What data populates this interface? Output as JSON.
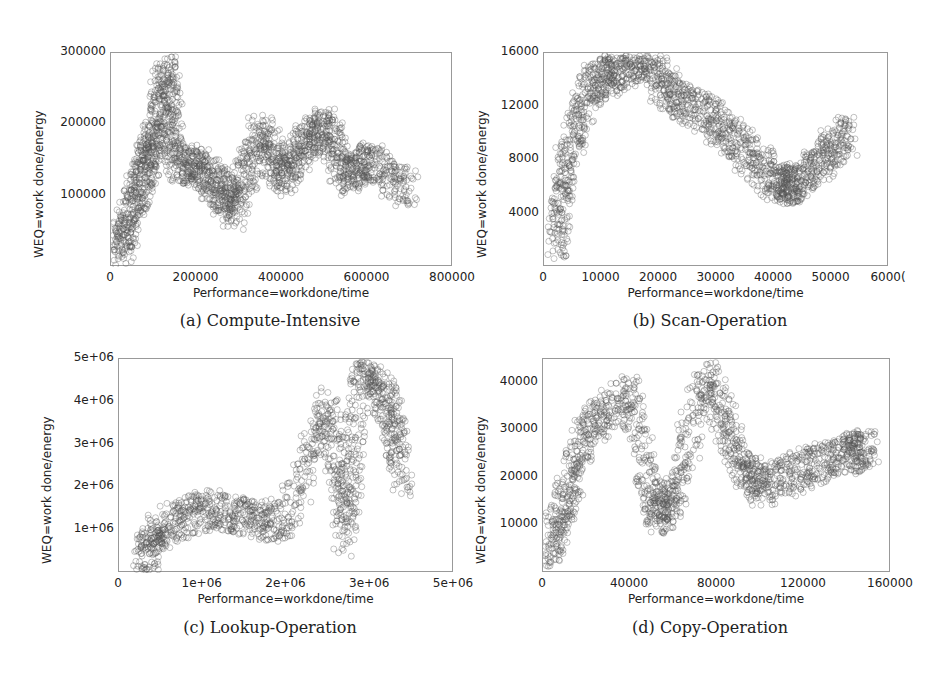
{
  "chart_data": [
    {
      "type": "scatter",
      "caption": "(a) Compute-Intensive",
      "xlabel": "Performance=workdone/time",
      "ylabel": "WEQ=work done/energy",
      "xlim": [
        0,
        800000
      ],
      "ylim": [
        0,
        300000
      ],
      "xticks": [
        "0",
        "200000",
        "400000",
        "600000",
        "800000"
      ],
      "yticks": [
        "100000",
        "200000",
        "300000"
      ],
      "marker": "open-circle",
      "points_description": "Dense cluster rising from origin to ~150000 perf; arcs peaking ~280000 WEQ near 130000 perf; diagonal streaks extending to ~700000 perf at 100000-220000 WEQ",
      "x": [
        20000,
        50000,
        80000,
        100000,
        130000,
        150000,
        200000,
        250000,
        290000,
        350000,
        400000,
        450000,
        500000,
        550000,
        600000,
        700000
      ],
      "y": [
        20000,
        80000,
        140000,
        180000,
        280000,
        150000,
        140000,
        110000,
        80000,
        190000,
        125000,
        170000,
        200000,
        125000,
        150000,
        105000
      ]
    },
    {
      "type": "scatter",
      "caption": "(b) Scan-Operation",
      "xlabel": "Performance=workdone/time",
      "ylabel": "WEQ=work done/energy",
      "xlim": [
        0,
        60000
      ],
      "ylim": [
        0,
        16000
      ],
      "xticks": [
        "0",
        "10000",
        "20000",
        "30000",
        "40000",
        "50000",
        "6000("
      ],
      "yticks": [
        "4000",
        "8000",
        "12000",
        "16000"
      ],
      "marker": "open-circle",
      "points_description": "Steep rise from ~1000 at 2000 perf to peak ~15500 near 17000 perf; broad arc decaying to ~6000 at 43000 perf; sparse outliers to 53000",
      "x": [
        2000,
        4000,
        8000,
        12000,
        17000,
        22000,
        28000,
        34000,
        40000,
        43000,
        48000,
        53000
      ],
      "y": [
        1000,
        8000,
        13500,
        14500,
        15500,
        13000,
        11500,
        9000,
        6500,
        6000,
        8000,
        10000
      ]
    },
    {
      "type": "scatter",
      "caption": "(c) Lookup-Operation",
      "xlabel": "Performance=workdone/time",
      "ylabel": "WEQ=work done/energy",
      "xlim": [
        0,
        4000000
      ],
      "ylim": [
        0,
        5000000
      ],
      "xticks": [
        "0",
        "1e+06",
        "2e+06",
        "3e+06",
        "5e+06"
      ],
      "yticks": [
        "1e+06",
        "2e+06",
        "3e+06",
        "4e+06",
        "5e+06"
      ],
      "marker": "open-circle",
      "points_description": "Dense blob 0.5e6-2.7e6 perf, 0.3e6-2e6 WEQ; sparse upper cloud rising to ~4.8e6 WEQ near 2.9e6 perf",
      "x": [
        250000,
        500000,
        1000000,
        1500000,
        2000000,
        2500000,
        2700000,
        2900000,
        3200000,
        3400000
      ],
      "y": [
        250000,
        1000000,
        1500000,
        1300000,
        1200000,
        4000000,
        800000,
        4800000,
        4000000,
        2200000
      ]
    },
    {
      "type": "scatter",
      "caption": "(d) Copy-Operation",
      "xlabel": "Performance=workdone/time",
      "ylabel": "WEQ=work done/energy",
      "xlim": [
        0,
        160000
      ],
      "ylim": [
        0,
        45000
      ],
      "xticks": [
        "0",
        "40000",
        "80000",
        "120000",
        "160000"
      ],
      "yticks": [
        "10000",
        "20000",
        "30000",
        "40000"
      ],
      "marker": "open-circle",
      "points_description": "Steep rise from ~2000 at 2000 perf to ~30000 at 20000; broad arc peaking ~42000 near 75000; decaying arcs and diagonal streaks to ~25000 at 150000",
      "x": [
        2000,
        10000,
        20000,
        40000,
        52000,
        60000,
        75000,
        90000,
        100000,
        120000,
        140000,
        150000
      ],
      "y": [
        2000,
        15000,
        30000,
        38000,
        12000,
        16000,
        42000,
        24000,
        18000,
        22000,
        25000,
        26000
      ]
    }
  ]
}
